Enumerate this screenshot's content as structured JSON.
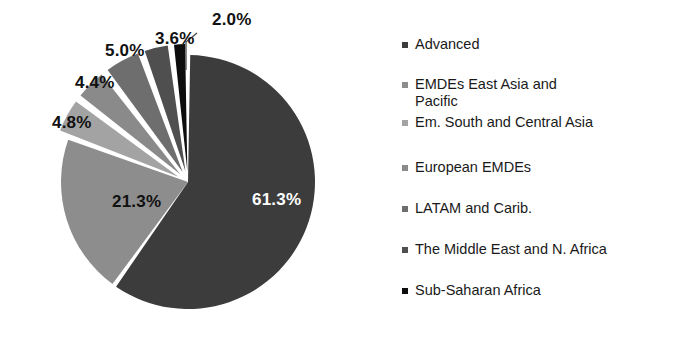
{
  "chart_data": {
    "type": "pie",
    "title": "",
    "categories": [
      "Advanced",
      "EMDEs East Asia and Pacific",
      "Em. South and Central Asia",
      "European EMDEs",
      "LATAM and Carib.",
      "The Middle East and N. Africa",
      "Sub-Saharan Africa"
    ],
    "values": [
      61.3,
      21.3,
      4.8,
      4.4,
      5.0,
      3.6,
      2.0
    ],
    "value_labels": [
      "61.3%",
      "21.3%",
      "4.8%",
      "4.4%",
      "5.0%",
      "3.6%",
      "2.0%"
    ],
    "colors": [
      "#3c3c3c",
      "#8d8d8d",
      "#a3a3a3",
      "#8a8a8a",
      "#6e6e6e",
      "#4f4f4f",
      "#0d0d0d"
    ],
    "label_colors": [
      "#ffffff",
      "#111111",
      "#111111",
      "#111111",
      "#111111",
      "#111111",
      "#111111"
    ],
    "units": "percent",
    "legend_position": "right",
    "grid": false,
    "exploded_slices": [
      "Em. South and Central Asia",
      "European EMDEs",
      "LATAM and Carib.",
      "The Middle East and N. Africa",
      "Sub-Saharan Africa"
    ]
  },
  "pie": {
    "slices": [
      {
        "name": "Advanced",
        "label": "61.3%",
        "value": 61.3,
        "color": "#3c3c3c",
        "label_color": "light",
        "label_x": 252,
        "label_y": 205
      },
      {
        "name": "EMDEs East Asia and Pacific",
        "label": "21.3%",
        "value": 21.3,
        "color": "#8d8d8d",
        "label_color": "dark",
        "label_x": 112,
        "label_y": 207
      },
      {
        "name": "Em. South and Central Asia",
        "label": "4.8%",
        "value": 4.8,
        "color": "#a3a3a3",
        "label_color": "dark",
        "label_x": 52,
        "label_y": 128
      },
      {
        "name": "European EMDEs",
        "label": "4.4%",
        "value": 4.4,
        "color": "#8a8a8a",
        "label_color": "dark",
        "label_x": 75,
        "label_y": 88
      },
      {
        "name": "LATAM and Carib.",
        "label": "5.0%",
        "value": 5.0,
        "color": "#6e6e6e",
        "label_color": "dark",
        "label_x": 105,
        "label_y": 56
      },
      {
        "name": "The Middle East and N. Africa",
        "label": "3.6%",
        "value": 3.6,
        "color": "#4f4f4f",
        "label_color": "dark",
        "label_x": 155,
        "label_y": 44
      },
      {
        "name": "Sub-Saharan Africa",
        "label": "2.0%",
        "value": 2.0,
        "color": "#0d0d0d",
        "label_color": "dark",
        "label_x": 212,
        "label_y": 25
      }
    ]
  },
  "legend": {
    "items": [
      {
        "label": "Advanced",
        "swatch": "#3c3c3c",
        "top": 36
      },
      {
        "label": "EMDEs East Asia and\nPacific",
        "swatch": "#8d8d8d",
        "top": 76
      },
      {
        "label": "Em. South and Central Asia",
        "swatch": "#a3a3a3",
        "top": 114
      },
      {
        "label": "European EMDEs",
        "swatch": "#8a8a8a",
        "top": 159
      },
      {
        "label": "LATAM and Carib.",
        "swatch": "#6e6e6e",
        "top": 200
      },
      {
        "label": "The Middle East and N. Africa",
        "swatch": "#4f4f4f",
        "top": 241
      },
      {
        "label": "Sub-Saharan Africa",
        "swatch": "#0d0d0d",
        "top": 282
      }
    ]
  }
}
